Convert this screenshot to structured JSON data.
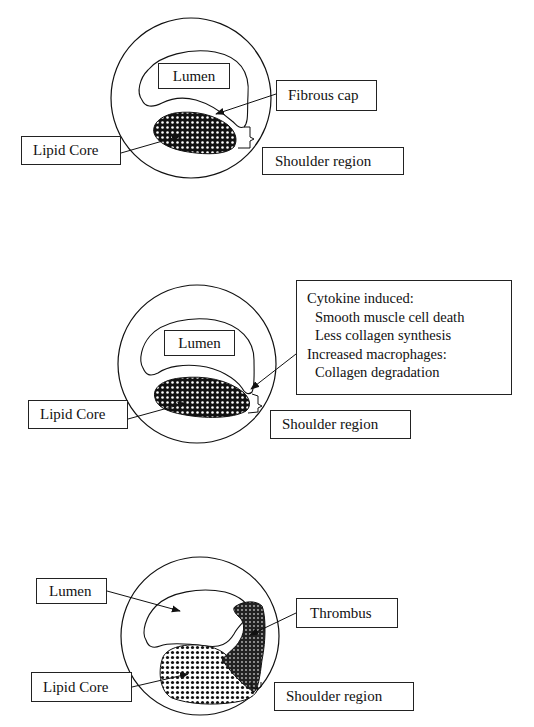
{
  "panels": [
    {
      "id": "panel-1-stable-plaque",
      "labels": {
        "lumen": "Lumen",
        "fibrous_cap": "Fibrous cap",
        "lipid_core": "Lipid Core",
        "shoulder_region": "Shoulder region"
      }
    },
    {
      "id": "panel-2-vulnerable-plaque",
      "labels": {
        "lumen": "Lumen",
        "lipid_core": "Lipid Core",
        "shoulder_region": "Shoulder region"
      },
      "mechanism_box": [
        {
          "text": "Cytokine induced:",
          "indent": false
        },
        {
          "text": "Smooth muscle cell death",
          "indent": true
        },
        {
          "text": "Less collagen synthesis",
          "indent": true
        },
        {
          "text": "Increased macrophages:",
          "indent": false
        },
        {
          "text": "Collagen degradation",
          "indent": true
        }
      ]
    },
    {
      "id": "panel-3-ruptured-plaque",
      "labels": {
        "lumen": "Lumen",
        "thrombus": "Thrombus",
        "lipid_core": "Lipid Core",
        "shoulder_region": "Shoulder region"
      }
    }
  ],
  "colors": {
    "stroke": "#111111",
    "background": "#ffffff",
    "lipid_fill": "#1a1a1a",
    "thrombus_fill": "#2a2a2a"
  }
}
